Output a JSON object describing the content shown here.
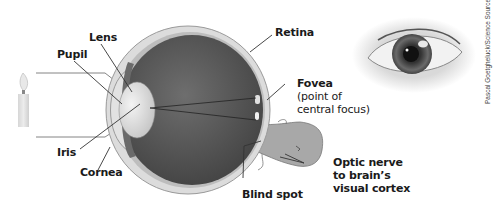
{
  "diagram": {
    "labels": {
      "lens": "Lens",
      "pupil": "Pupil",
      "iris": "Iris",
      "cornea": "Cornea",
      "retina": "Retina",
      "fovea": "Fovea",
      "fovea_note_1": "(point of",
      "fovea_note_2": "central focus)",
      "blind_spot": "Blind spot",
      "optic_1": "Optic nerve",
      "optic_2": "to brain’s",
      "optic_3": "visual cortex"
    },
    "photo_credit": "Pascal Goetgheluck/Science Source",
    "colors": {
      "eyeball_interior": "#5a5a5a",
      "sclera": "#d8d8d8",
      "lens": "#e6e6e6",
      "optic_nerve": "#a8a8a8",
      "label_text": "#1a1a1a"
    }
  }
}
